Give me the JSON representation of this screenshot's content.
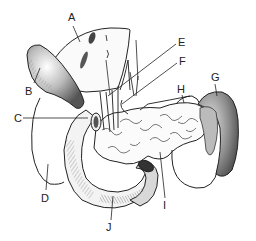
{
  "diagram": {
    "type": "anatomical-illustration",
    "labels": [
      {
        "id": "A",
        "text": "A",
        "x": 68,
        "y": 12
      },
      {
        "id": "B",
        "text": "B",
        "x": 25,
        "y": 86
      },
      {
        "id": "C",
        "text": "C",
        "x": 14,
        "y": 116
      },
      {
        "id": "D",
        "text": "D",
        "x": 40,
        "y": 196
      },
      {
        "id": "E",
        "text": "E",
        "x": 178,
        "y": 38
      },
      {
        "id": "F",
        "text": "F",
        "x": 179,
        "y": 57
      },
      {
        "id": "G",
        "text": "G",
        "x": 211,
        "y": 72
      },
      {
        "id": "H",
        "text": "H",
        "x": 177,
        "y": 84
      },
      {
        "id": "I",
        "text": "I",
        "x": 163,
        "y": 200
      },
      {
        "id": "J",
        "text": "J",
        "x": 106,
        "y": 222
      }
    ],
    "colors": {
      "ink": "#222222",
      "shade": "#8a8a8a",
      "dark_shade": "#555555",
      "background": "#ffffff"
    }
  }
}
